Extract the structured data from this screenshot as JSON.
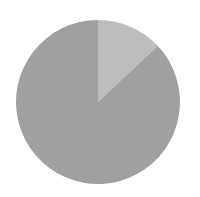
{
  "chart_data": {
    "type": "pie",
    "title": "",
    "labels": [
      "Slice A",
      "Slice B"
    ],
    "values": [
      13,
      87
    ],
    "colors": [
      "#bdbdbd",
      "#a0a0a0"
    ],
    "start_angle_deg": 0,
    "direction": "clockwise",
    "legend": "none",
    "data_labels": "none"
  },
  "layout": {
    "center_x": 98,
    "center_y": 102,
    "radius": 82,
    "background": "#ffffff"
  }
}
